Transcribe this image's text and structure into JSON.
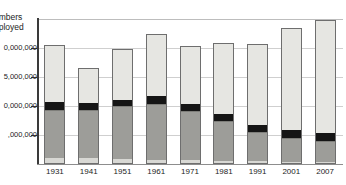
{
  "chart_data": {
    "type": "bar",
    "title": "",
    "subtitle": "",
    "stacked": true,
    "xlabel": "",
    "ylabel": "Numbers Unemployed",
    "ylabel_clipped": "umbers\nnployed",
    "ylim": [
      0,
      25000000
    ],
    "ytick_values": [
      5000000,
      10000000,
      15000000,
      20000000
    ],
    "ytick_labels": [
      "5,000,000",
      "10,000,000",
      "15,000,000",
      "20,000,000"
    ],
    "ytick_labels_clipped": [
      ",000,000",
      "0,000,000",
      "5,000,000",
      "0,000,000"
    ],
    "grid": true,
    "grid_axis": "y",
    "legend": "none",
    "categories": [
      "1931",
      "1941",
      "1951",
      "1961",
      "1971",
      "1981",
      "1991",
      "2001",
      "2007"
    ],
    "series": [
      {
        "name": "primary",
        "color": "#e6e6e2",
        "values": [
          900000,
          800000,
          700000,
          600000,
          450000,
          400000,
          300000,
          250000,
          200000
        ]
      },
      {
        "name": "secondary",
        "color": "#9d9d99",
        "values": [
          8300000,
          8300000,
          9100000,
          9600000,
          8600000,
          6800000,
          5000000,
          4100000,
          3600000
        ]
      },
      {
        "name": "tertiary-manual",
        "color": "#151515",
        "values": [
          1400000,
          1200000,
          1100000,
          1300000,
          1100000,
          1200000,
          1300000,
          1300000,
          1400000
        ]
      },
      {
        "name": "services",
        "color": "#d8d8d4",
        "values": [
          9600000,
          5900000,
          8500000,
          10600000,
          9800000,
          12100000,
          13700000,
          17500000,
          19200000
        ]
      }
    ],
    "totals": [
      20200000,
      16200000,
      19400000,
      22100000,
      19950000,
      20500000,
      20300000,
      23150000,
      24400000
    ]
  },
  "axis": {
    "y_title_line1": "umbers",
    "y_title_line2": "nployed"
  }
}
